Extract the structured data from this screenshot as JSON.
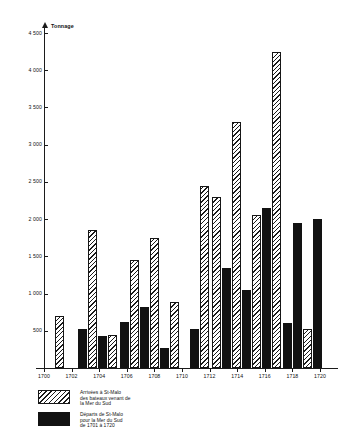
{
  "chart_data": {
    "type": "bar",
    "title": "",
    "ylabel": "Tonnage",
    "xlabel": "",
    "ylim": [
      0,
      4500
    ],
    "yticks": [
      500,
      1000,
      1500,
      2000,
      2500,
      3000,
      3500,
      4000,
      4500
    ],
    "ytick_labels": [
      "500",
      "1 000",
      "1 500",
      "2 000",
      "2 500",
      "3 000",
      "3 500",
      "4 000",
      "4 500"
    ],
    "xtick_labels": [
      "1700",
      "1702",
      "1704",
      "1706",
      "1708",
      "1710",
      "1712",
      "1714",
      "1716",
      "1718",
      "1720"
    ],
    "x": [
      1701,
      1702,
      1703,
      1704,
      1705,
      1706,
      1707,
      1708,
      1710,
      1711,
      1712,
      1713,
      1714,
      1715,
      1716,
      1717,
      1718,
      1719,
      1720
    ],
    "grid": false,
    "legend_position": "below-left",
    "series": [
      {
        "name": "Arrivées à St-Malo des bateaux venant de la Mer du Sud",
        "fill": "hatched",
        "color": "#ffffff",
        "values": [
          700,
          0,
          1850,
          440,
          1450,
          1150,
          1750,
          880,
          2450,
          2300,
          3300,
          2050,
          4250,
          1950,
          520,
          0,
          0,
          620,
          650
        ]
      },
      {
        "name": "Départs de St-Malo pour la Mer du Sud de 1701 à 1720",
        "fill": "solid",
        "color": "#121212",
        "values": [
          0,
          520,
          430,
          0,
          620,
          820,
          270,
          0,
          520,
          1350,
          1050,
          2150,
          600,
          1950,
          2000,
          1950,
          150,
          280,
          0
        ]
      }
    ],
    "bars": [
      {
        "name": "arr-1701",
        "series": "arrivals",
        "year": 1701,
        "value": 700,
        "x": 55,
        "w": 9
      },
      {
        "name": "dep-1702",
        "series": "departures",
        "year": 1702,
        "value": 520,
        "x": 78,
        "w": 9
      },
      {
        "name": "arr-1703",
        "series": "arrivals",
        "year": 1703,
        "value": 1850,
        "x": 88,
        "w": 9
      },
      {
        "name": "dep-1703",
        "series": "departures",
        "year": 1703,
        "value": 430,
        "x": 98,
        "w": 9
      },
      {
        "name": "arr-1704",
        "series": "arrivals",
        "year": 1704,
        "value": 440,
        "x": 108,
        "w": 9
      },
      {
        "name": "dep-1705",
        "series": "departures",
        "year": 1705,
        "value": 620,
        "x": 120,
        "w": 9
      },
      {
        "name": "arr-1705",
        "series": "arrivals",
        "year": 1705,
        "value": 1450,
        "x": 130,
        "w": 9
      },
      {
        "name": "dep-1706",
        "series": "departures",
        "year": 1706,
        "value": 820,
        "x": 140,
        "w": 9
      },
      {
        "name": "arr-1707",
        "series": "arrivals",
        "year": 1707,
        "value": 1750,
        "x": 150,
        "w": 9
      },
      {
        "name": "dep-1707",
        "series": "departures",
        "year": 1707,
        "value": 270,
        "x": 160,
        "w": 9
      },
      {
        "name": "arr-1708",
        "series": "arrivals",
        "year": 1708,
        "value": 880,
        "x": 170,
        "w": 9
      },
      {
        "name": "dep-1710",
        "series": "departures",
        "year": 1710,
        "value": 520,
        "x": 190,
        "w": 9
      },
      {
        "name": "arr-1710",
        "series": "arrivals",
        "year": 1710,
        "value": 2450,
        "x": 200,
        "w": 9
      },
      {
        "name": "arr-1711",
        "series": "arrivals",
        "year": 1711,
        "value": 2300,
        "x": 212,
        "w": 9
      },
      {
        "name": "dep-1711",
        "series": "departures",
        "year": 1711,
        "value": 1350,
        "x": 222,
        "w": 9
      },
      {
        "name": "arr-1712",
        "series": "arrivals",
        "year": 1712,
        "value": 3300,
        "x": 232,
        "w": 9
      },
      {
        "name": "dep-1712",
        "series": "departures",
        "year": 1712,
        "value": 1050,
        "x": 242,
        "w": 9
      },
      {
        "name": "arr-1713",
        "series": "arrivals",
        "year": 1713,
        "value": 2050,
        "x": 252,
        "w": 9
      },
      {
        "name": "dep-1713",
        "series": "departures",
        "year": 1713,
        "value": 2150,
        "x": 262,
        "w": 9
      },
      {
        "name": "arr-1714",
        "series": "arrivals",
        "year": 1714,
        "value": 4250,
        "x": 272,
        "w": 9
      },
      {
        "name": "dep-1714",
        "series": "departures",
        "year": 1714,
        "value": 600,
        "x": 283,
        "w": 9
      },
      {
        "name": "arr-1715",
        "series": "arrivals",
        "year": 1715,
        "value": 1950,
        "x": 250,
        "w": 0
      },
      {
        "name": "dep-1715",
        "series": "departures",
        "year": 1715,
        "value": 1950,
        "x": 293,
        "w": 9
      },
      {
        "name": "arr-1716",
        "series": "arrivals",
        "year": 1716,
        "value": 520,
        "x": 303,
        "w": 9
      },
      {
        "name": "dep-1716",
        "series": "departures",
        "year": 1716,
        "value": 2000,
        "x": 313,
        "w": 9
      },
      {
        "name": "dep-1717",
        "series": "departures",
        "year": 1717,
        "value": 1950,
        "x": 300,
        "w": 0
      }
    ]
  },
  "legend": {
    "items": [
      {
        "key": "arrivals",
        "swatch": "hatched",
        "label": "Arrivées à St-Malo\ndes bateaux venant de\nla Mer du Sud"
      },
      {
        "key": "departures",
        "swatch": "solid",
        "label": "Départs de St-Malo\npour la Mer du Sud\nde 1701 à 1720"
      }
    ]
  },
  "colors": {
    "axis": "#1b1b1b",
    "solid_series": "#121212",
    "hatch_series": "#ffffff",
    "background": "#ffffff"
  }
}
